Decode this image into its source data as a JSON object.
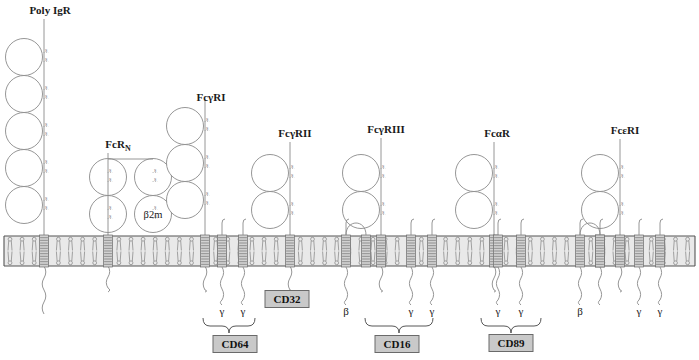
{
  "figure": {
    "background": "#ffffff",
    "membrane_color": "#e9e9e9",
    "tm_helix_color": "#d2d2d2",
    "cd_box_color": "#c9c9c9",
    "outline_color": "#8a8a8a"
  },
  "receptors": [
    {
      "id": "poly-igr",
      "label": "Poly IgR",
      "label_x": 50,
      "label_y": 14,
      "stalk_x": 44,
      "ig_domains": 5,
      "ig_top_y": 44,
      "tm_x": 44,
      "tail": "long-wavy",
      "cd": null,
      "chains": []
    },
    {
      "id": "fcrn",
      "label": "FcR",
      "label_sub": "N",
      "label_x": 118,
      "label_y": 148,
      "stalk_x": 129,
      "ig_domains": 2,
      "ig_top_y": 164,
      "tm_x": 129,
      "tail": "short-wavy",
      "cd": null,
      "beta2m_label": "β2m",
      "chains": []
    },
    {
      "id": "fcgri",
      "label": "FcγRI",
      "label_x": 211,
      "label_y": 101,
      "stalk_x": 205,
      "ig_domains": 3,
      "ig_top_y": 113,
      "tm_x": 205,
      "tail": "short-wavy",
      "cd": "CD64",
      "chains": [
        "γ",
        "γ"
      ]
    },
    {
      "id": "fcgrii",
      "label": "FcγRII",
      "label_x": 295,
      "label_y": 137,
      "stalk_x": 290,
      "ig_domains": 2,
      "ig_top_y": 160,
      "tm_x": 290,
      "tail": "short-wavy",
      "cd": "CD32",
      "chains": []
    },
    {
      "id": "fcgriii",
      "label": "FcγRIII",
      "label_x": 386,
      "label_y": 133,
      "stalk_x": 381,
      "ig_domains": 2,
      "ig_top_y": 160,
      "tm_x": 381,
      "tail": "short-wavy",
      "cd": "CD16",
      "chains": [
        "β",
        "γ",
        "γ"
      ]
    },
    {
      "id": "fcar",
      "label": "FcαR",
      "label_x": 497,
      "label_y": 137,
      "stalk_x": 494,
      "ig_domains": 2,
      "ig_top_y": 160,
      "tm_x": 494,
      "tail": "short-wavy",
      "cd": "CD89",
      "chains": [
        "γ",
        "γ"
      ]
    },
    {
      "id": "fceri",
      "label": "FcεRI",
      "label_x": 625,
      "label_y": 134,
      "stalk_x": 620,
      "ig_domains": 2,
      "ig_top_y": 160,
      "tm_x": 620,
      "tail": "short-wavy",
      "cd": null,
      "chains": [
        "β",
        "γ",
        "γ"
      ]
    }
  ],
  "cd_labels": [
    {
      "text": "CD32",
      "x": 287,
      "y": 299
    },
    {
      "text": "CD64",
      "x": 235,
      "y": 344
    },
    {
      "text": "CD16",
      "x": 397,
      "y": 344
    },
    {
      "text": "CD89",
      "x": 511,
      "y": 343
    }
  ],
  "chain_labels": [
    {
      "text": "γ",
      "x": 222,
      "y": 315
    },
    {
      "text": "γ",
      "x": 243,
      "y": 315
    },
    {
      "text": "β",
      "x": 346,
      "y": 315
    },
    {
      "text": "γ",
      "x": 411,
      "y": 315
    },
    {
      "text": "γ",
      "x": 432,
      "y": 315
    },
    {
      "text": "γ",
      "x": 498,
      "y": 315
    },
    {
      "text": "γ",
      "x": 521,
      "y": 315
    },
    {
      "text": "β",
      "x": 580,
      "y": 315
    },
    {
      "text": "γ",
      "x": 639,
      "y": 315
    },
    {
      "text": "γ",
      "x": 660,
      "y": 315
    }
  ],
  "disulfide_label": "S",
  "membrane": {
    "top_y": 236,
    "bottom_y": 266,
    "left_x": 4,
    "right_x": 695
  }
}
